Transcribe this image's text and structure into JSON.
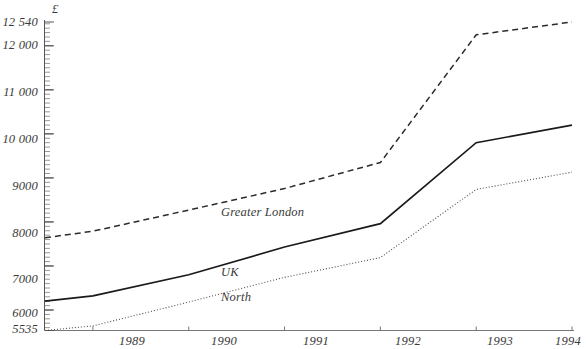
{
  "chart_data": {
    "type": "line",
    "title": "",
    "xlabel": "",
    "ylabel": "£",
    "unit_symbol": "£",
    "x": [
      1988.5,
      1989,
      1990,
      1991,
      1992,
      1993,
      1994
    ],
    "xlim": [
      1988.5,
      1994
    ],
    "ylim": [
      5535,
      12540
    ],
    "grid": false,
    "legend_position": "inline-labels",
    "x_ticks": [
      "1989",
      "1990",
      "1991",
      "1992",
      "1993",
      "1994"
    ],
    "y_ticks": [
      "5535",
      "6000",
      "7000",
      "8000",
      "9000",
      "10 000",
      "11 000",
      "12 000",
      "12 540"
    ],
    "y_tick_values": [
      5535,
      6000,
      7000,
      8000,
      9000,
      10000,
      11000,
      12000,
      12540
    ],
    "series": [
      {
        "name": "Greater London",
        "style": "dashed",
        "color": "#2b2b2b",
        "values": [
          7640,
          7790,
          8270,
          8760,
          9350,
          12250,
          12540
        ]
      },
      {
        "name": "UK",
        "style": "solid",
        "color": "#1a1a1a",
        "values": [
          6200,
          6320,
          6800,
          7430,
          7960,
          9800,
          10200
        ]
      },
      {
        "name": "North",
        "style": "dotted",
        "color": "#4a4a4a",
        "values": [
          5535,
          5640,
          6180,
          6740,
          7190,
          8740,
          9130
        ]
      }
    ]
  },
  "axis": {
    "unit": "£",
    "x_labels": [
      "1989",
      "1990",
      "1991",
      "1992",
      "1993",
      "1994"
    ],
    "y_labels": [
      "12 540",
      "12 000",
      "11 000",
      "10 000",
      "9000",
      "8000",
      "7000",
      "6000",
      "5535"
    ]
  },
  "series_labels": {
    "greater_london": "Greater London",
    "uk": "UK",
    "north": "North"
  }
}
